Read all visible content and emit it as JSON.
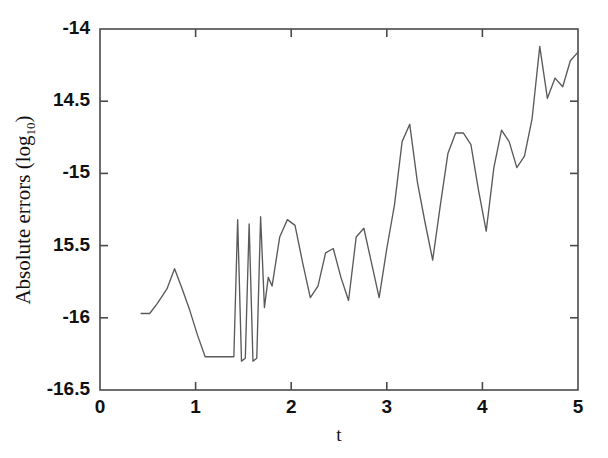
{
  "chart_data": {
    "type": "line",
    "title": "",
    "xlabel": "t",
    "ylabel": "Absolute errors (log10)",
    "ylabel_base": "Absolute errors (log",
    "ylabel_sub": "10",
    "ylabel_close": ")",
    "xlim": [
      0,
      5
    ],
    "ylim": [
      -16.5,
      -14
    ],
    "grid": false,
    "legend": null,
    "xticks": [
      0,
      1,
      2,
      3,
      4,
      5
    ],
    "xtick_labels": [
      "0",
      "1",
      "2",
      "3",
      "4",
      "5"
    ],
    "yticks": [
      -14,
      -14.5,
      -15,
      -15.5,
      -16,
      -16.5
    ],
    "ytick_labels": [
      "-14",
      "14.5",
      "-15",
      "15.5",
      "-16",
      "-16.5"
    ],
    "line_color": "#5a5a5a",
    "axis_color": "#4a4a4a",
    "series": [
      {
        "name": "absolute error",
        "x": [
          0.43,
          0.52,
          0.6,
          0.7,
          0.78,
          0.86,
          0.94,
          1.02,
          1.1,
          1.18,
          1.4,
          1.44,
          1.48,
          1.52,
          1.56,
          1.6,
          1.64,
          1.68,
          1.72,
          1.76,
          1.8,
          1.88,
          1.96,
          2.04,
          2.12,
          2.2,
          2.28,
          2.36,
          2.44,
          2.52,
          2.6,
          2.68,
          2.76,
          2.84,
          2.92,
          3.0,
          3.08,
          3.16,
          3.24,
          3.32,
          3.4,
          3.48,
          3.56,
          3.64,
          3.72,
          3.8,
          3.88,
          3.96,
          4.04,
          4.12,
          4.2,
          4.28,
          4.36,
          4.44,
          4.52,
          4.6,
          4.68,
          4.76,
          4.84,
          4.92,
          5.0
        ],
        "y": [
          -15.97,
          -15.97,
          -15.9,
          -15.8,
          -15.66,
          -15.8,
          -15.95,
          -16.12,
          -16.27,
          -16.27,
          -16.27,
          -15.32,
          -16.3,
          -16.28,
          -15.35,
          -16.3,
          -16.28,
          -15.3,
          -15.93,
          -15.72,
          -15.78,
          -15.44,
          -15.32,
          -15.36,
          -15.62,
          -15.86,
          -15.78,
          -15.55,
          -15.52,
          -15.72,
          -15.88,
          -15.44,
          -15.38,
          -15.62,
          -15.86,
          -15.52,
          -15.22,
          -14.78,
          -14.66,
          -15.06,
          -15.34,
          -15.6,
          -15.22,
          -14.86,
          -14.72,
          -14.72,
          -14.8,
          -15.12,
          -15.4,
          -14.96,
          -14.7,
          -14.78,
          -14.96,
          -14.88,
          -14.62,
          -14.12,
          -14.48,
          -14.34,
          -14.4,
          -14.22,
          -14.16
        ]
      }
    ]
  }
}
